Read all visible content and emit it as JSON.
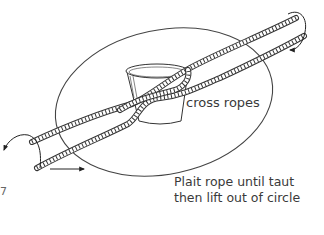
{
  "diagram": {
    "labels": {
      "cross_ropes": "cross ropes",
      "instruction_line1": "Plait rope until taut",
      "instruction_line2": "then lift out of circle",
      "edge_mark": "7"
    },
    "elements": [
      {
        "type": "ellipse",
        "name": "circle-boundary"
      },
      {
        "type": "bucket",
        "name": "bucket"
      },
      {
        "type": "rope",
        "name": "upper-rope"
      },
      {
        "type": "rope",
        "name": "lower-rope"
      },
      {
        "type": "arrow",
        "name": "top-right-curved-arrow",
        "direction": "clockwise-down"
      },
      {
        "type": "arrow",
        "name": "left-curved-arrow",
        "direction": "down-left"
      },
      {
        "type": "arrow",
        "name": "bottom-straight-arrow",
        "direction": "right"
      }
    ],
    "colors": {
      "line": "#333333",
      "text": "#3a3a3a",
      "background": "#ffffff"
    }
  }
}
